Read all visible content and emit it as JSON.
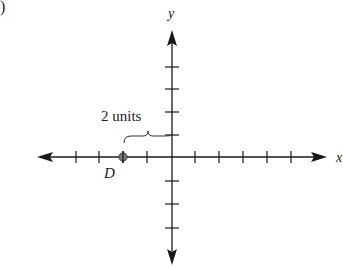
{
  "figure": {
    "part_marker": ")",
    "x_axis_label": "x",
    "y_axis_label": "y",
    "annotation": "2 units",
    "point": {
      "label": "D",
      "x": -2,
      "y": 0
    },
    "tick_spacing_units": 1,
    "x_ticks_left": 4,
    "x_ticks_right": 5,
    "y_ticks_up": 4,
    "y_ticks_down": 3,
    "colors": {
      "ink": "#1a1a1a",
      "point": "#666666"
    }
  }
}
